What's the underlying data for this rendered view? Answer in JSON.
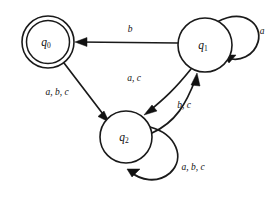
{
  "diagram": {
    "type": "finite-state-automaton",
    "background_color": "#ffffff",
    "stroke_color": "#1a1a1a",
    "alphabet": [
      "a",
      "b",
      "c"
    ],
    "states": [
      {
        "id": "q0",
        "label": "q",
        "subscript": "0",
        "accepting": true,
        "shape": "double-circle",
        "cx": 48,
        "cy": 42,
        "r_outer": 26,
        "r_inner": 21.5
      },
      {
        "id": "q1",
        "label": "q",
        "subscript": "1",
        "accepting": false,
        "shape": "circle",
        "cx": 205,
        "cy": 45,
        "r_outer": 27,
        "r_inner": 0
      },
      {
        "id": "q2",
        "label": "q",
        "subscript": "2",
        "accepting": false,
        "shape": "circle",
        "cx": 126,
        "cy": 137,
        "r_outer": 26,
        "r_inner": 0
      }
    ],
    "transitions": [
      {
        "id": "t-q1-q0",
        "from": "q1",
        "to": "q0",
        "label": "b",
        "label_x": 130,
        "label_y": 30,
        "kind": "straight"
      },
      {
        "id": "t-q0-q2",
        "from": "q0",
        "to": "q2",
        "label": "a, b, c",
        "label_x": 57,
        "label_y": 93,
        "kind": "straight"
      },
      {
        "id": "t-q1-q2",
        "from": "q1",
        "to": "q2",
        "label": "a, c",
        "label_x": 134,
        "label_y": 79,
        "kind": "curve"
      },
      {
        "id": "t-q2-q1",
        "from": "q2",
        "to": "q1",
        "label": "b, c",
        "label_x": 184,
        "label_y": 106,
        "kind": "curve"
      },
      {
        "id": "t-q1-q1",
        "from": "q1",
        "to": "q1",
        "label": "a",
        "label_x": 262,
        "label_y": 32,
        "kind": "self-loop"
      },
      {
        "id": "t-q2-q2",
        "from": "q2",
        "to": "q2",
        "label": "a, b, c",
        "label_x": 193,
        "label_y": 168,
        "kind": "self-loop"
      }
    ]
  }
}
